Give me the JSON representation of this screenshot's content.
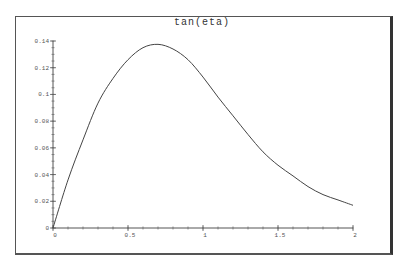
{
  "chart_data": {
    "type": "line",
    "title": "tan(eta)",
    "xlabel": "",
    "ylabel": "",
    "xlim": [
      0,
      2
    ],
    "ylim": [
      0,
      0.14
    ],
    "grid": false,
    "legend": null,
    "x_ticks": [
      0,
      0.5,
      1,
      1.5,
      2
    ],
    "x_tick_labels": [
      "0",
      "0.5",
      "1",
      "1.5",
      "2"
    ],
    "y_ticks": [
      0,
      0.02,
      0.04,
      0.06,
      0.08,
      0.1,
      0.12,
      0.14
    ],
    "y_tick_labels": [
      "0",
      "0.02",
      "0.04",
      "0.06",
      "0.08",
      "0.1",
      "0.12",
      "0.14"
    ],
    "series": [
      {
        "name": "tan(eta)",
        "color": "#444444",
        "x": [
          0,
          0.1,
          0.2,
          0.3,
          0.4,
          0.5,
          0.6,
          0.7,
          0.8,
          0.9,
          1.0,
          1.1,
          1.2,
          1.3,
          1.4,
          1.5,
          1.6,
          1.7,
          1.8,
          1.9,
          2.0
        ],
        "y": [
          0,
          0.036,
          0.066,
          0.0935,
          0.112,
          0.126,
          0.135,
          0.1375,
          0.134,
          0.126,
          0.113,
          0.098,
          0.084,
          0.07,
          0.057,
          0.047,
          0.039,
          0.031,
          0.025,
          0.021,
          0.017
        ]
      }
    ]
  }
}
